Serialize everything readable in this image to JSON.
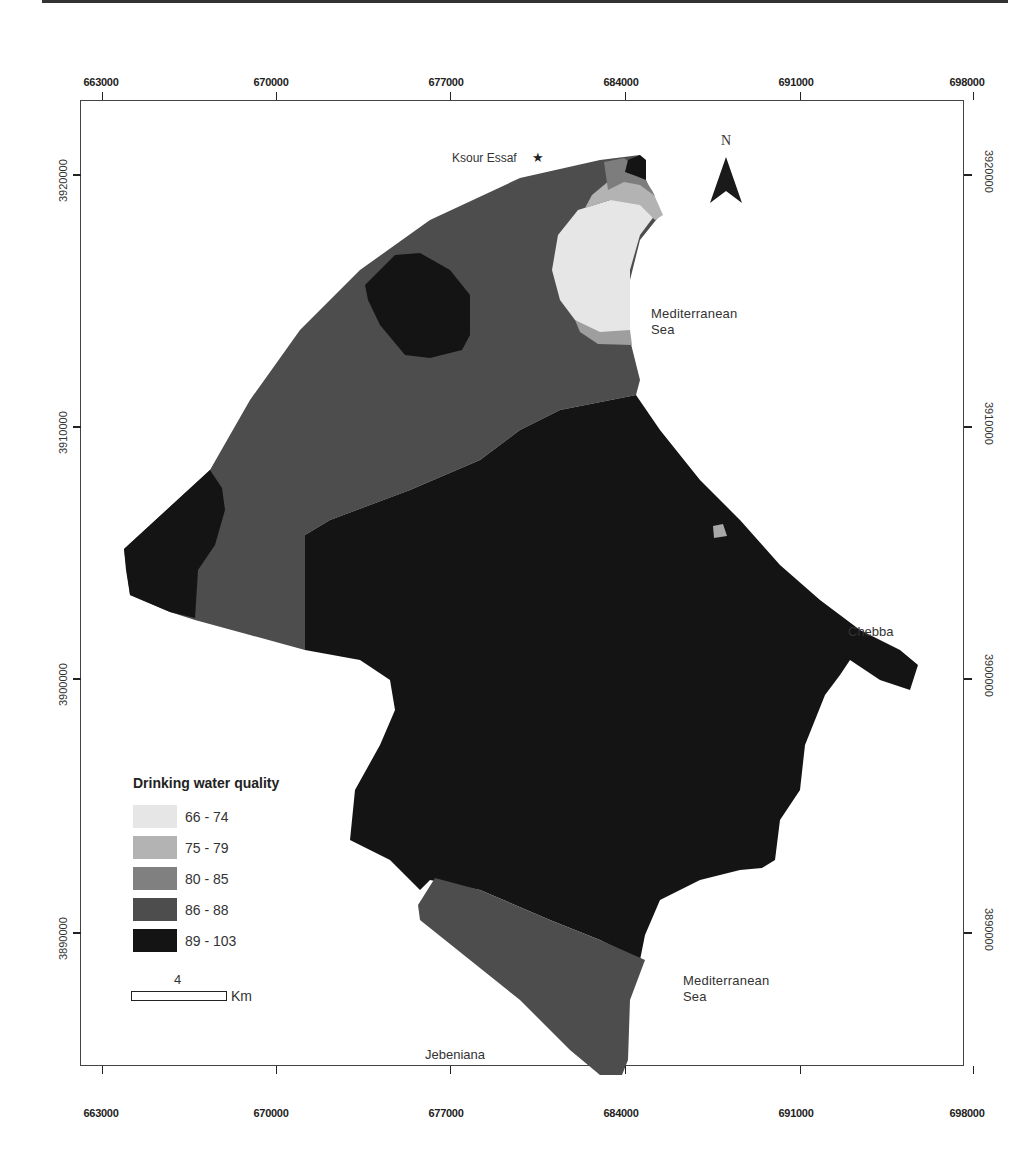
{
  "map": {
    "legend": {
      "title": "Drinking water quality",
      "classes": [
        {
          "label": "66 - 74",
          "color": "#e6e6e6"
        },
        {
          "label": "75 - 79",
          "color": "#b3b3b3"
        },
        {
          "label": "80 - 85",
          "color": "#808080"
        },
        {
          "label": "86 - 88",
          "color": "#4d4d4d"
        },
        {
          "label": "89 - 103",
          "color": "#141414"
        }
      ]
    },
    "scale_bar": {
      "value": "4",
      "unit": "Km"
    },
    "north_arrow": {
      "label": "N"
    },
    "x_axis_ticks": [
      "663000",
      "670000",
      "677000",
      "684000",
      "691000",
      "698000"
    ],
    "y_axis_ticks": [
      "3920000",
      "3910000",
      "3900000",
      "3890000"
    ],
    "places": {
      "ksour_essaf": "Ksour Essaf",
      "chebba": "Chebba",
      "jebeniana": "Jebeniana"
    },
    "sea_labels": {
      "north_line1": "Mediterranean",
      "north_line2": "Sea",
      "south_line1": "Mediterranean",
      "south_line2": "Sea"
    },
    "icons": {
      "town_marker": "★"
    }
  }
}
